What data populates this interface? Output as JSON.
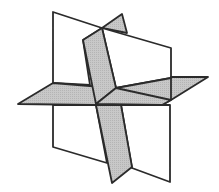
{
  "diagram": {
    "colors": {
      "background": "#ffffff",
      "white_plane": "#ffffff",
      "gray_plane": "#c4c4c4",
      "edge": "#2b2b2b"
    },
    "planes": [
      {
        "name": "vertical-back-plane",
        "fill": "white"
      },
      {
        "name": "horizontal-plane",
        "fill": "gray"
      },
      {
        "name": "tilted-slab-plane",
        "fill": "gray"
      }
    ]
  }
}
